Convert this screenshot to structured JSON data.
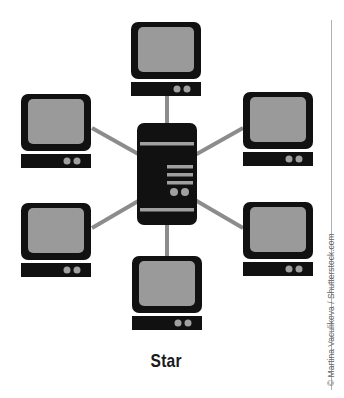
{
  "diagram": {
    "title": "Star",
    "credit": "© Martina Vaculikova / Shutterstock.com",
    "topology": "star",
    "hub": {
      "type": "server",
      "name": "central-server"
    },
    "nodes": [
      {
        "name": "top-computer",
        "position": "top"
      },
      {
        "name": "upper-left-computer",
        "position": "upper-left"
      },
      {
        "name": "upper-right-computer",
        "position": "upper-right"
      },
      {
        "name": "lower-left-computer",
        "position": "lower-left"
      },
      {
        "name": "lower-right-computer",
        "position": "lower-right"
      },
      {
        "name": "bottom-computer",
        "position": "bottom"
      }
    ],
    "colors": {
      "device_body": "#111111",
      "screen": "#9a9a9a",
      "link": "#8c8c8c",
      "indicator": "#a0a0a0",
      "background": "#ffffff"
    }
  }
}
